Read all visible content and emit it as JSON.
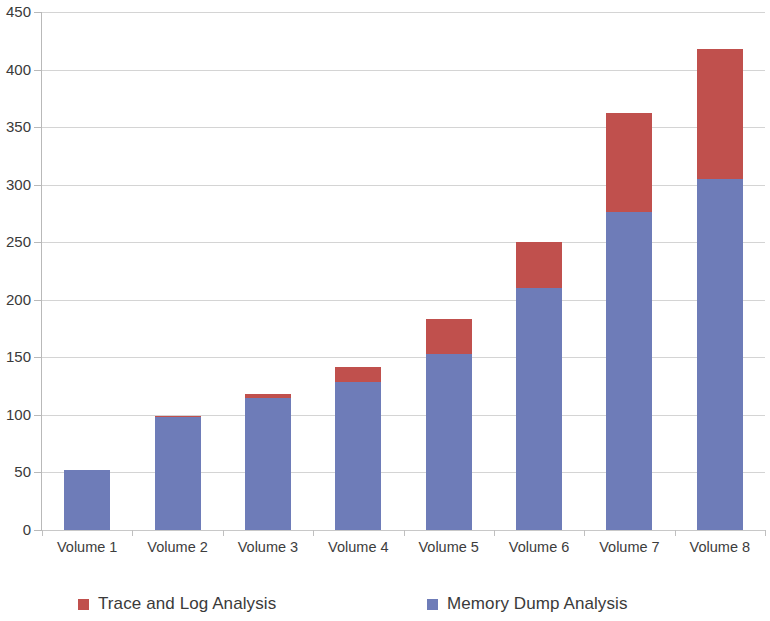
{
  "chart_data": {
    "type": "bar",
    "subtype": "stacked-vertical",
    "title": "",
    "xlabel": "",
    "ylabel": "",
    "ylim": [
      0,
      450
    ],
    "ytick_step": 50,
    "yticks": [
      0,
      50,
      100,
      150,
      200,
      250,
      300,
      350,
      400,
      450
    ],
    "ytick_labels": [
      "0",
      "50",
      "100",
      "150",
      "200",
      "250",
      "300",
      "350",
      "400",
      "450"
    ],
    "grid": "horizontal",
    "legend_position": "bottom",
    "categories": [
      "Volume 1",
      "Volume 2",
      "Volume 3",
      "Volume 4",
      "Volume 5",
      "Volume 6",
      "Volume 7",
      "Volume 8"
    ],
    "series": [
      {
        "name": "Memory Dump Analysis",
        "color": "#6e7cb8",
        "stack_order": "bottom",
        "values": [
          52,
          98,
          115,
          129,
          153,
          210,
          276,
          305
        ]
      },
      {
        "name": "Trace and Log Analysis",
        "color": "#c0504d",
        "stack_order": "top",
        "values": [
          0,
          1,
          3,
          13,
          30,
          40,
          86,
          113
        ]
      }
    ],
    "totals": [
      52,
      99,
      118,
      142,
      183,
      250,
      362,
      418
    ]
  },
  "legend": {
    "items": [
      {
        "label": "Trace and Log Analysis",
        "color": "#c0504d"
      },
      {
        "label": "Memory Dump Analysis",
        "color": "#6e7cb8"
      }
    ]
  }
}
